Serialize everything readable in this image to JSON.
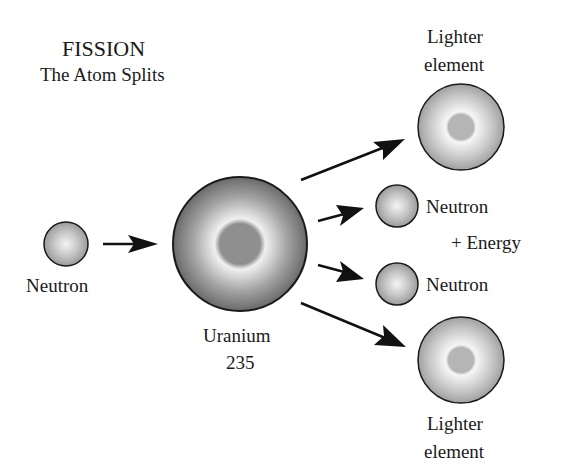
{
  "title": "FISSION",
  "subtitle": "The Atom Splits",
  "labels": {
    "neutron_in": "Neutron",
    "uranium_line1": "Uranium",
    "uranium_line2": "235",
    "lighter_top_line1": "Lighter",
    "lighter_top_line2": "element",
    "neutron_out_1": "Neutron",
    "energy": "+ Energy",
    "neutron_out_2": "Neutron",
    "lighter_bottom_line1": "Lighter",
    "lighter_bottom_line2": "element"
  },
  "colors": {
    "outline": "#1a1a1a",
    "nucleus": "#8f8f8f",
    "shell_dark": "#6e6e6e",
    "shell_light": "#f2f2f2"
  }
}
